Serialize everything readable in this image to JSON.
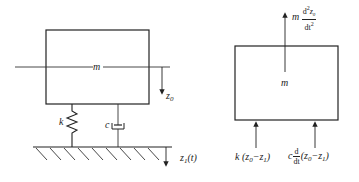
{
  "figure": {
    "left_diagram": {
      "name": "mass-spring-damper system",
      "mass_label": "m",
      "spring_label": "k",
      "damper_label": "c",
      "displacement_mass": {
        "symbol": "z",
        "subscript": "0"
      },
      "displacement_base": {
        "symbol": "z",
        "subscript": "1",
        "arg": "(t)"
      }
    },
    "right_diagram": {
      "name": "free body diagram",
      "mass_label": "m",
      "inertia_force": {
        "coef": "m",
        "num": "d²z₀",
        "num_base": "d",
        "num_exp": "2",
        "num_var": "z",
        "num_sub": "0",
        "den": "dt",
        "den_exp": "2"
      },
      "spring_force": {
        "coef": "k",
        "expr_open": "(z",
        "sub0": "0",
        "minus": "−z",
        "sub1": "1",
        "close": ")"
      },
      "damper_force": {
        "coef": "c",
        "num": "d",
        "den": "dt",
        "expr_open": "(z",
        "sub0": "0",
        "minus": "−z",
        "sub1": "1",
        "close": ")"
      }
    },
    "colors": {
      "line": "#222222",
      "background": "#ffffff"
    }
  }
}
